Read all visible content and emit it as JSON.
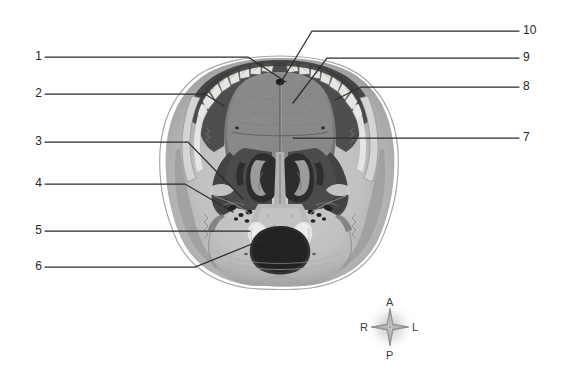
{
  "figure": {
    "background_color": "#ffffff",
    "illustration": {
      "name": "skull-inferior-view",
      "description": "Grayscale halftone anatomical illustration of the base of the skull viewed from below, showing the dental arch, hard palate, choanae, foramina, occipital condyles and foramen magnum.",
      "tone_light": "#cfcfcf",
      "tone_mid": "#9a9a9a",
      "tone_dark": "#4a4a4a",
      "tone_darkest": "#1e1e1e"
    }
  },
  "leader_color": "#2b2b2b",
  "labels": {
    "left": [
      {
        "id": "1",
        "text": "1",
        "y": 57
      },
      {
        "id": "2",
        "text": "2",
        "y": 94
      },
      {
        "id": "3",
        "text": "3",
        "y": 142
      },
      {
        "id": "4",
        "text": "4",
        "y": 184
      },
      {
        "id": "5",
        "text": "5",
        "y": 231
      },
      {
        "id": "6",
        "text": "6",
        "y": 267
      }
    ],
    "right": [
      {
        "id": "10",
        "text": "10",
        "y": 31
      },
      {
        "id": "9",
        "text": "9",
        "y": 58
      },
      {
        "id": "8",
        "text": "8",
        "y": 87
      },
      {
        "id": "7",
        "text": "7",
        "y": 138
      }
    ]
  },
  "compass": {
    "name": "orientation-compass-rose",
    "anterior": "A",
    "posterior": "P",
    "right": "R",
    "left": "L"
  }
}
